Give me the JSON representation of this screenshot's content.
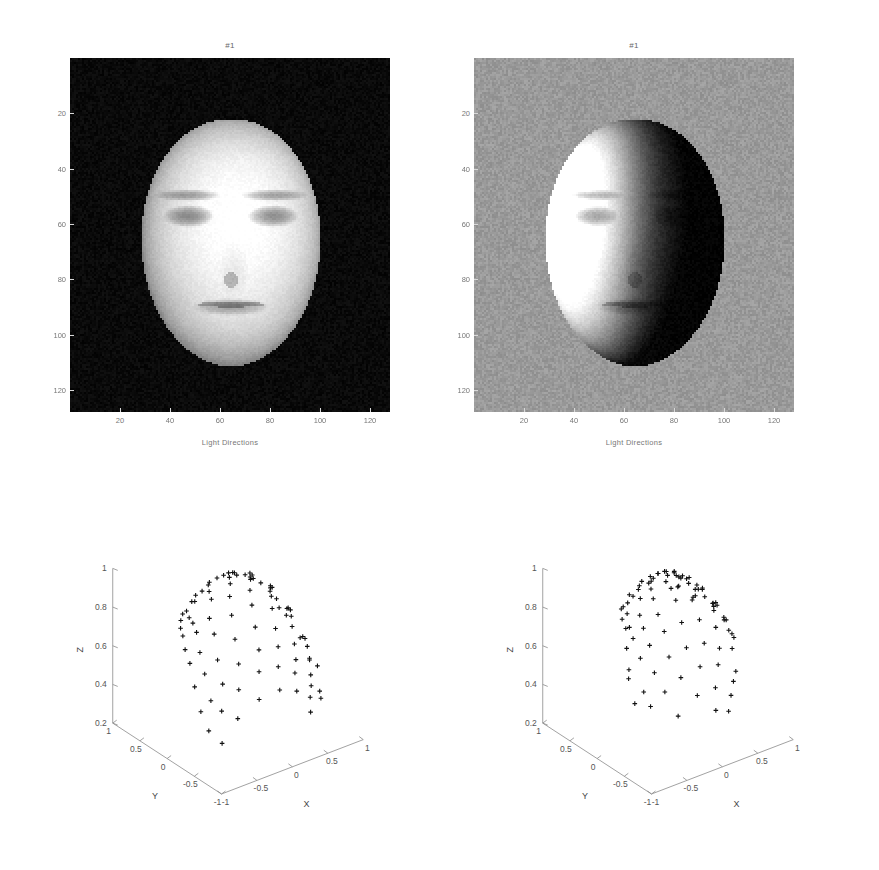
{
  "figure": {
    "kind": "matlab-figure",
    "layout": "2x2",
    "background": "#ffffff"
  },
  "panels": {
    "top_left": {
      "title": "#1",
      "caption": "Light Directions",
      "image_kind": "grayscale-face-photograph",
      "image_description": "frontally lit face on black background",
      "xticks": [
        "20",
        "40",
        "60",
        "80",
        "100",
        "120"
      ],
      "yticks": [
        "20",
        "40",
        "60",
        "80",
        "100",
        "120"
      ],
      "xlim": [
        0,
        128
      ],
      "ylim": [
        0,
        128
      ],
      "background_tone": "#0a0a0a",
      "face_tone": "#e8e4de"
    },
    "top_right": {
      "title": "#1",
      "caption": "Light Directions",
      "image_kind": "grayscale-face-photograph",
      "image_description": "side lit face on mid-gray background",
      "xticks": [
        "20",
        "40",
        "60",
        "80",
        "100",
        "120"
      ],
      "yticks": [
        "20",
        "40",
        "60",
        "80",
        "100",
        "120"
      ],
      "xlim": [
        0,
        128
      ],
      "ylim": [
        0,
        128
      ],
      "background_tone": "#9a9a9a",
      "face_tone": "#555050"
    },
    "bottom_left": {
      "xlabel": "X",
      "ylabel": "Y",
      "zlabel": "Z",
      "xticks": [
        "-1",
        "-0.5",
        "0",
        "0.5",
        "1"
      ],
      "yticks": [
        "1",
        "0.5",
        "0",
        "-0.5",
        "-1"
      ],
      "zticks": [
        "0.2",
        "0.4",
        "0.6",
        "0.8",
        "1"
      ],
      "xlim": [
        -1,
        1
      ],
      "ylim": [
        -1,
        1
      ],
      "zlim": [
        0.2,
        1
      ],
      "marker": "+",
      "point_count": 92
    },
    "bottom_right": {
      "xlabel": "X",
      "ylabel": "Y",
      "zlabel": "Z",
      "xticks": [
        "-1",
        "-0.5",
        "0",
        "0.5",
        "1"
      ],
      "yticks": [
        "1",
        "0.5",
        "0",
        "-0.5",
        "-1"
      ],
      "zticks": [
        "0.2",
        "0.4",
        "0.6",
        "0.8",
        "1"
      ],
      "xlim": [
        -1,
        1
      ],
      "ylim": [
        -1,
        1
      ],
      "zlim": [
        0.2,
        1
      ],
      "marker": "+",
      "point_count": 92
    }
  },
  "chart_data": [
    {
      "id": "bottom-left-light-directions",
      "type": "scatter",
      "title": "",
      "xlabel": "X",
      "ylabel": "Y",
      "zlabel": "Z",
      "xlim": [
        -1,
        1
      ],
      "ylim": [
        -1,
        1
      ],
      "zlim": [
        0.2,
        1
      ],
      "xticks": [
        -1,
        -0.5,
        0,
        0.5,
        1
      ],
      "yticks": [
        1,
        0.5,
        0,
        -0.5,
        -1
      ],
      "zticks": [
        0.2,
        0.4,
        0.6,
        0.8,
        1
      ],
      "grid": false,
      "legend": "none",
      "marker": "+",
      "projection": "3d",
      "note": "light source directions on the upper unit hemisphere, regular grid-like sampling",
      "points": [
        [
          -0.02,
          0.36,
          0.93
        ],
        [
          0.14,
          0.28,
          0.95
        ],
        [
          0.22,
          0.31,
          0.92
        ],
        [
          0.4,
          0.24,
          0.89
        ],
        [
          -0.26,
          0.44,
          0.86
        ],
        [
          -0.2,
          0.4,
          0.88
        ],
        [
          0.05,
          0.33,
          0.94
        ],
        [
          0.3,
          0.26,
          0.92
        ],
        [
          0.46,
          0.18,
          0.87
        ],
        [
          0.62,
          0.1,
          0.78
        ],
        [
          0.68,
          0.13,
          0.72
        ],
        [
          -0.42,
          0.47,
          0.78
        ],
        [
          -0.33,
          0.42,
          0.84
        ],
        [
          -0.12,
          0.37,
          0.92
        ],
        [
          0.18,
          0.3,
          0.94
        ],
        [
          0.34,
          0.22,
          0.91
        ],
        [
          0.56,
          0.14,
          0.82
        ],
        [
          0.72,
          0.05,
          0.69
        ],
        [
          -0.5,
          0.4,
          0.77
        ],
        [
          -0.45,
          0.36,
          0.82
        ],
        [
          -0.38,
          0.3,
          0.87
        ],
        [
          -0.22,
          0.26,
          0.94
        ],
        [
          0.02,
          0.2,
          0.98
        ],
        [
          0.26,
          0.12,
          0.96
        ],
        [
          0.48,
          0.03,
          0.88
        ],
        [
          0.66,
          -0.04,
          0.75
        ],
        [
          0.8,
          -0.1,
          0.59
        ],
        [
          -0.58,
          0.3,
          0.76
        ],
        [
          -0.52,
          0.22,
          0.82
        ],
        [
          -0.3,
          0.14,
          0.94
        ],
        [
          -0.06,
          0.08,
          0.99
        ],
        [
          0.2,
          0.0,
          0.98
        ],
        [
          0.42,
          -0.08,
          0.9
        ],
        [
          0.6,
          -0.14,
          0.78
        ],
        [
          0.76,
          -0.2,
          0.62
        ],
        [
          0.84,
          -0.22,
          0.5
        ],
        [
          -0.64,
          0.18,
          0.75
        ],
        [
          -0.56,
          0.1,
          0.82
        ],
        [
          -0.36,
          0.02,
          0.93
        ],
        [
          -0.14,
          -0.04,
          0.99
        ],
        [
          0.1,
          -0.1,
          0.99
        ],
        [
          0.32,
          -0.18,
          0.93
        ],
        [
          0.54,
          -0.26,
          0.8
        ],
        [
          0.7,
          -0.32,
          0.64
        ],
        [
          0.86,
          -0.34,
          0.48
        ],
        [
          -0.7,
          0.06,
          0.71
        ],
        [
          -0.6,
          -0.02,
          0.8
        ],
        [
          -0.48,
          -0.1,
          0.87
        ],
        [
          -0.24,
          -0.16,
          0.96
        ],
        [
          0.0,
          -0.22,
          0.97
        ],
        [
          0.24,
          -0.3,
          0.92
        ],
        [
          0.46,
          -0.38,
          0.8
        ],
        [
          0.64,
          -0.44,
          0.63
        ],
        [
          0.8,
          -0.46,
          0.38
        ],
        [
          -0.74,
          -0.08,
          0.67
        ],
        [
          -0.66,
          -0.16,
          0.73
        ],
        [
          -0.52,
          -0.24,
          0.82
        ],
        [
          -0.32,
          -0.3,
          0.9
        ],
        [
          -0.08,
          -0.36,
          0.93
        ],
        [
          0.16,
          -0.42,
          0.89
        ],
        [
          0.38,
          -0.5,
          0.78
        ],
        [
          0.58,
          -0.56,
          0.59
        ],
        [
          0.74,
          -0.56,
          0.37
        ],
        [
          -0.78,
          -0.22,
          0.58
        ],
        [
          -0.7,
          -0.3,
          0.65
        ],
        [
          -0.58,
          -0.38,
          0.72
        ],
        [
          -0.38,
          -0.44,
          0.81
        ],
        [
          -0.14,
          -0.5,
          0.85
        ],
        [
          0.1,
          -0.56,
          0.82
        ],
        [
          0.32,
          -0.62,
          0.72
        ],
        [
          0.52,
          -0.66,
          0.54
        ],
        [
          -0.8,
          -0.36,
          0.48
        ],
        [
          -0.72,
          -0.44,
          0.54
        ],
        [
          -0.6,
          -0.5,
          0.62
        ],
        [
          -0.42,
          -0.56,
          0.71
        ],
        [
          -0.18,
          -0.62,
          0.76
        ],
        [
          0.06,
          -0.66,
          0.75
        ],
        [
          0.28,
          -0.7,
          0.66
        ],
        [
          0.48,
          -0.72,
          0.5
        ],
        [
          -0.78,
          -0.48,
          0.4
        ],
        [
          -0.66,
          -0.56,
          0.5
        ],
        [
          -0.48,
          -0.64,
          0.6
        ],
        [
          -0.24,
          -0.7,
          0.67
        ],
        [
          0.0,
          -0.74,
          0.67
        ],
        [
          0.22,
          -0.76,
          0.61
        ],
        [
          0.42,
          -0.78,
          0.46
        ],
        [
          -0.7,
          -0.62,
          0.35
        ],
        [
          -0.54,
          -0.7,
          0.47
        ],
        [
          -0.3,
          -0.78,
          0.55
        ],
        [
          -0.04,
          -0.82,
          0.57
        ],
        [
          0.2,
          -0.82,
          0.53
        ],
        [
          0.38,
          -0.84,
          0.4
        ]
      ]
    },
    {
      "id": "bottom-right-light-directions",
      "type": "scatter",
      "title": "",
      "xlabel": "X",
      "ylabel": "Y",
      "zlabel": "Z",
      "xlim": [
        -1,
        1
      ],
      "ylim": [
        -1,
        1
      ],
      "zlim": [
        0.2,
        1
      ],
      "xticks": [
        -1,
        -0.5,
        0,
        0.5,
        1
      ],
      "yticks": [
        1,
        0.5,
        0,
        -0.5,
        -1
      ],
      "zticks": [
        0.2,
        0.4,
        0.6,
        0.8,
        1
      ],
      "grid": false,
      "legend": "none",
      "marker": "+",
      "projection": "3d",
      "note": "recovered / estimated light source directions, irregular clustered sampling",
      "points": [
        [
          0.06,
          0.26,
          0.96
        ],
        [
          0.24,
          0.2,
          0.95
        ],
        [
          0.3,
          0.24,
          0.92
        ],
        [
          0.33,
          0.23,
          0.91
        ],
        [
          0.4,
          0.18,
          0.9
        ],
        [
          0.46,
          0.22,
          0.86
        ],
        [
          -0.14,
          0.3,
          0.94
        ],
        [
          -0.05,
          0.26,
          0.96
        ],
        [
          0.12,
          0.22,
          0.97
        ],
        [
          0.16,
          0.24,
          0.96
        ],
        [
          0.52,
          0.12,
          0.84
        ],
        [
          0.58,
          0.08,
          0.8
        ],
        [
          -0.3,
          0.32,
          0.89
        ],
        [
          -0.22,
          0.24,
          0.94
        ],
        [
          -0.02,
          0.16,
          0.99
        ],
        [
          0.18,
          0.12,
          0.98
        ],
        [
          0.36,
          0.08,
          0.93
        ],
        [
          0.5,
          0.02,
          0.86
        ],
        [
          0.62,
          -0.02,
          0.78
        ],
        [
          0.66,
          0.02,
          0.75
        ],
        [
          -0.46,
          0.26,
          0.85
        ],
        [
          -0.44,
          0.25,
          0.86
        ],
        [
          -0.4,
          0.22,
          0.88
        ],
        [
          -0.28,
          0.18,
          0.94
        ],
        [
          -0.34,
          0.2,
          0.91
        ],
        [
          -0.18,
          0.12,
          0.97
        ],
        [
          -0.16,
          0.1,
          0.98
        ],
        [
          -0.1,
          0.14,
          0.98
        ],
        [
          0.04,
          0.06,
          0.99
        ],
        [
          0.22,
          0.02,
          0.97
        ],
        [
          0.44,
          -0.06,
          0.89
        ],
        [
          0.6,
          -0.12,
          0.79
        ],
        [
          0.68,
          -0.14,
          0.72
        ],
        [
          0.7,
          -0.12,
          0.7
        ],
        [
          -0.54,
          0.14,
          0.83
        ],
        [
          -0.5,
          0.1,
          0.86
        ],
        [
          -0.36,
          0.04,
          0.93
        ],
        [
          -0.24,
          0.0,
          0.97
        ],
        [
          -0.06,
          -0.04,
          0.99
        ],
        [
          0.12,
          -0.08,
          0.99
        ],
        [
          0.3,
          -0.14,
          0.94
        ],
        [
          0.52,
          -0.2,
          0.83
        ],
        [
          -0.58,
          0.02,
          0.81
        ],
        [
          -0.56,
          -0.02,
          0.82
        ],
        [
          -0.46,
          -0.08,
          0.88
        ],
        [
          -0.3,
          -0.12,
          0.95
        ],
        [
          -0.08,
          -0.16,
          0.98
        ],
        [
          0.0,
          -0.18,
          0.98
        ],
        [
          0.02,
          -0.17,
          0.98
        ],
        [
          0.2,
          -0.24,
          0.95
        ],
        [
          0.4,
          -0.3,
          0.86
        ],
        [
          0.56,
          -0.34,
          0.76
        ],
        [
          -0.66,
          -0.1,
          0.74
        ],
        [
          -0.6,
          -0.14,
          0.79
        ],
        [
          -0.5,
          -0.2,
          0.84
        ],
        [
          -0.34,
          -0.26,
          0.9
        ],
        [
          -0.12,
          -0.3,
          0.95
        ],
        [
          0.08,
          -0.34,
          0.93
        ],
        [
          0.1,
          -0.33,
          0.94
        ],
        [
          0.14,
          -0.32,
          0.94
        ],
        [
          0.34,
          -0.4,
          0.85
        ],
        [
          0.52,
          -0.44,
          0.73
        ],
        [
          0.58,
          -0.42,
          0.7
        ],
        [
          0.6,
          -0.43,
          0.68
        ],
        [
          -0.74,
          -0.24,
          0.62
        ],
        [
          -0.72,
          -0.22,
          0.66
        ],
        [
          -0.62,
          -0.3,
          0.72
        ],
        [
          -0.52,
          -0.34,
          0.78
        ],
        [
          -0.36,
          -0.4,
          0.84
        ],
        [
          -0.16,
          -0.46,
          0.87
        ],
        [
          0.06,
          -0.5,
          0.86
        ],
        [
          0.26,
          -0.54,
          0.8
        ],
        [
          0.46,
          -0.58,
          0.67
        ],
        [
          -0.76,
          -0.38,
          0.52
        ],
        [
          -0.68,
          -0.44,
          0.58
        ],
        [
          -0.56,
          -0.48,
          0.67
        ],
        [
          -0.4,
          -0.54,
          0.74
        ],
        [
          -0.2,
          -0.6,
          0.77
        ],
        [
          0.02,
          -0.64,
          0.77
        ],
        [
          0.22,
          -0.66,
          0.72
        ],
        [
          0.42,
          -0.7,
          0.58
        ],
        [
          -0.66,
          -0.54,
          0.52
        ],
        [
          -0.52,
          -0.62,
          0.59
        ],
        [
          -0.34,
          -0.68,
          0.65
        ],
        [
          -0.1,
          -0.72,
          0.68
        ],
        [
          0.14,
          -0.74,
          0.66
        ],
        [
          0.34,
          -0.76,
          0.55
        ],
        [
          -0.44,
          -0.76,
          0.48
        ],
        [
          -0.2,
          -0.8,
          0.56
        ],
        [
          0.04,
          -0.82,
          0.57
        ],
        [
          0.26,
          -0.82,
          0.5
        ],
        [
          0.0,
          -0.88,
          0.47
        ],
        [
          0.18,
          -0.88,
          0.44
        ]
      ]
    }
  ]
}
